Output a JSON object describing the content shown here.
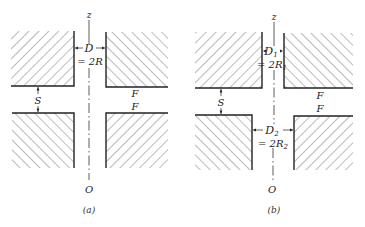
{
  "figure": {
    "panels": [
      {
        "id": "a",
        "caption": "(a)",
        "axis_top_label": "z",
        "axis_bottom_label": "O",
        "gap_label": "S",
        "diameter_label": "D",
        "diameter_eq": "= 2R",
        "face_labels": [
          "F",
          "F"
        ]
      },
      {
        "id": "b",
        "caption": "(b)",
        "axis_top_label": "z",
        "axis_bottom_label": "O",
        "gap_label": "S",
        "diameter1_label": "D",
        "diameter1_sub": "1",
        "diameter1_eq": "= 2R",
        "diameter1_eq_sub": "1",
        "diameter2_label": "D",
        "diameter2_sub": "2",
        "diameter2_eq": "= 2R",
        "diameter2_eq_sub": "2",
        "face_labels": [
          "F",
          "F"
        ]
      }
    ]
  }
}
